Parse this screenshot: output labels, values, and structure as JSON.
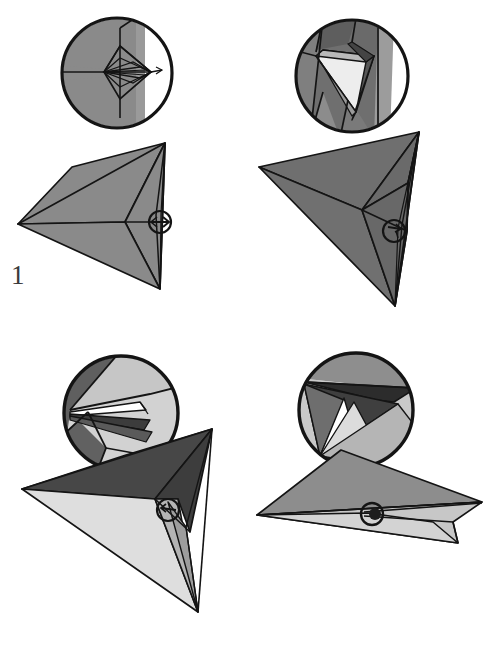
{
  "figure": {
    "kind": "origami-folding-sequence",
    "panel_count": 4,
    "background_color": "#ffffff",
    "outline_color": "#141414",
    "palette": {
      "white": "#ffffff",
      "very_light_gray": "#e8e8e8",
      "light_gray": "#d2d2d2",
      "mid_gray": "#8a8a8a",
      "gray": "#7d7d7d",
      "dark_gray": "#5c5c5c",
      "darker_gray": "#4a4a4a",
      "near_black": "#2e2e2e"
    }
  },
  "panels": [
    {
      "id": "panel-1",
      "number": "1",
      "detail_circle": {
        "label": "detail-inset-1",
        "center_x": 117,
        "center_y": 73,
        "radius": 56,
        "description": "magnified view of narrow lens-shaped pleat with radiating crease lines"
      },
      "model": {
        "label": "folded-model-1",
        "description": "kite-like four-sided folded form, uniform mid-gray, central crease point with pointer marker at right edge"
      },
      "marker": {
        "label": "pointer-marker-1",
        "center_x": 160,
        "center_y": 222,
        "radius": 11,
        "glyph": "arrow"
      }
    },
    {
      "id": "panel-2",
      "number": "2",
      "detail_circle": {
        "label": "detail-inset-2",
        "center_x": 352,
        "center_y": 76,
        "radius": 57,
        "description": "magnified view of opened triangular pocket with white inner face"
      },
      "model": {
        "label": "folded-model-2",
        "description": "dark gray triangular folded form rotated, pocket being spread open"
      },
      "marker": {
        "label": "pointer-marker-2",
        "center_x": 394,
        "center_y": 231,
        "radius": 11,
        "glyph": "arrow"
      }
    },
    {
      "id": "panel-3",
      "number": "3",
      "detail_circle": {
        "label": "detail-inset-3",
        "center_x": 121,
        "center_y": 413,
        "radius": 58,
        "description": "magnified view of a flattened spread squash fold, dark gray above and light gray below"
      },
      "model": {
        "label": "folded-model-3",
        "description": "arrow / dart shaped model, dark gray upper plane and light gray lower plane meeting at a long spine"
      },
      "marker": {
        "label": "pointer-marker-3",
        "center_x": 168,
        "center_y": 566,
        "radius": 11,
        "glyph": "arrow"
      }
    },
    {
      "id": "panel-4",
      "number": "4",
      "detail_circle": {
        "label": "detail-inset-4",
        "center_x": 356,
        "center_y": 410,
        "radius": 58,
        "description": "magnified view of layered point with white, light gray and dark gray nested triangles"
      },
      "model": {
        "label": "folded-model-4",
        "description": "flattened wide triangular model seen nearly edge-on, mid-gray upper plane with light gray lower flap"
      },
      "marker": {
        "label": "pointer-marker-4",
        "center_x": 372,
        "center_y": 558,
        "radius": 11,
        "glyph": "circle"
      }
    }
  ]
}
